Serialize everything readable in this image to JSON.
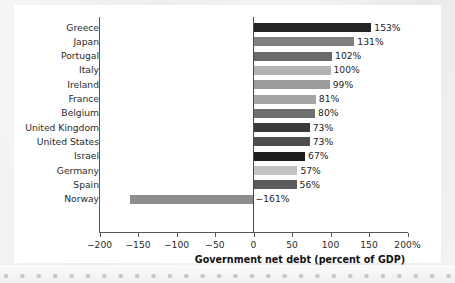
{
  "chart_data": {
    "type": "bar",
    "orientation": "horizontal",
    "title": "",
    "xlabel": "Government net debt (percent of GDP)",
    "ylabel": "",
    "xlim": [
      -200,
      200
    ],
    "grid": false,
    "legend": null,
    "categories": [
      "Greece",
      "Japan",
      "Portugal",
      "Italy",
      "Ireland",
      "France",
      "Belgium",
      "United Kingdom",
      "United States",
      "Israel",
      "Germany",
      "Spain",
      "Norway"
    ],
    "values": [
      153,
      131,
      102,
      100,
      99,
      81,
      80,
      73,
      73,
      67,
      57,
      56,
      -161
    ],
    "value_labels": [
      "153%",
      "131%",
      "102%",
      "100%",
      "99%",
      "81%",
      "80%",
      "73%",
      "73%",
      "67%",
      "57%",
      "56%",
      "−161%"
    ],
    "bar_colors": [
      "#242424",
      "#808080",
      "#6b6b6b",
      "#b3b3b3",
      "#9b9b9b",
      "#a5a5a5",
      "#6f6f6f",
      "#3a3a3a",
      "#4f4f4f",
      "#1c1c1c",
      "#c2c2c2",
      "#5b5b5b",
      "#8d8d8d"
    ],
    "xticks": [
      -200,
      -150,
      -100,
      -50,
      0,
      50,
      100,
      150,
      200
    ],
    "xtick_labels": [
      "−200",
      "−150",
      "−100",
      "−50",
      "0",
      "50",
      "100",
      "150",
      "200%"
    ],
    "axis_color": "#585858"
  }
}
